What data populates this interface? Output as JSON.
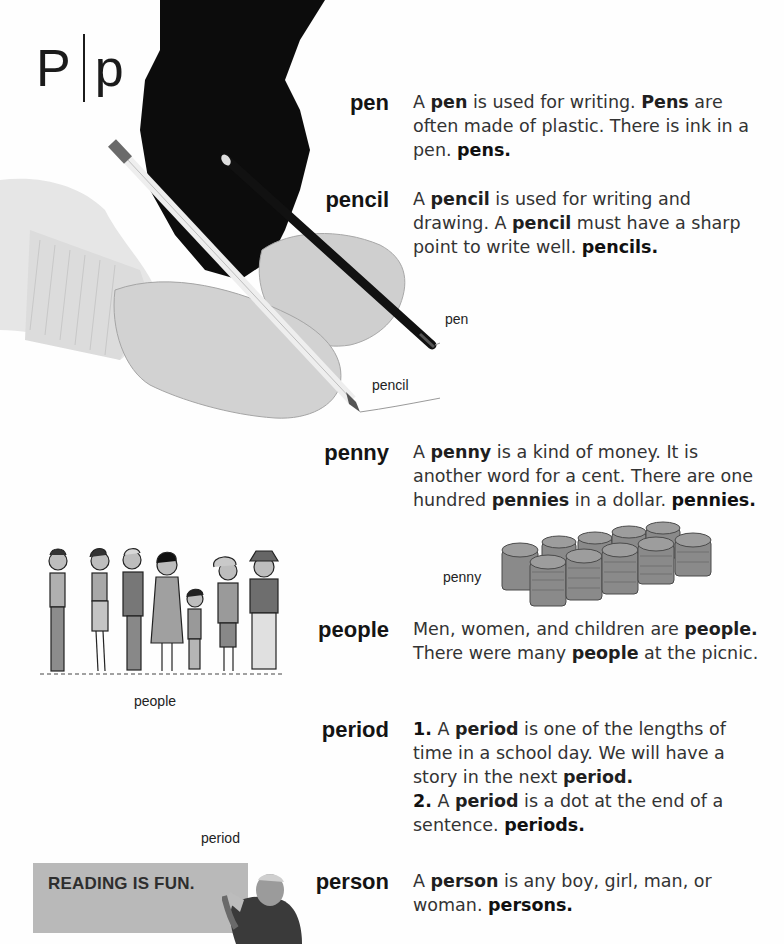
{
  "header": {
    "uppercase": "P",
    "lowercase": "p"
  },
  "entries": [
    {
      "word": "pen",
      "definition": [
        {
          "t": "A "
        },
        {
          "t": "pen",
          "k": "kw"
        },
        {
          "t": " is used for writing. "
        },
        {
          "t": "Pens",
          "k": "kw"
        },
        {
          "t": " are often made of plastic. There is ink in a pen. "
        },
        {
          "t": "pens.",
          "k": "plural"
        }
      ]
    },
    {
      "word": "pencil",
      "definition": [
        {
          "t": "A "
        },
        {
          "t": "pencil",
          "k": "kw"
        },
        {
          "t": " is used for writing and drawing. A "
        },
        {
          "t": "pencil",
          "k": "kw"
        },
        {
          "t": " must have a sharp point to write well. "
        },
        {
          "t": "pencils.",
          "k": "plural"
        }
      ]
    },
    {
      "word": "penny",
      "definition": [
        {
          "t": "A "
        },
        {
          "t": "penny",
          "k": "kw"
        },
        {
          "t": " is a kind of money. It is another word for a cent. There are one hundred "
        },
        {
          "t": "pennies",
          "k": "kw"
        },
        {
          "t": " in a dollar. "
        },
        {
          "t": "pennies.",
          "k": "plural"
        }
      ]
    },
    {
      "word": "people",
      "definition": [
        {
          "t": "Men, women, and children are "
        },
        {
          "t": "people.",
          "k": "kw"
        },
        {
          "t": " There were many "
        },
        {
          "t": "people",
          "k": "kw"
        },
        {
          "t": " at the picnic."
        }
      ]
    },
    {
      "word": "period",
      "definition": [
        {
          "t": "1.",
          "k": "num"
        },
        {
          "t": " A "
        },
        {
          "t": "period",
          "k": "kw"
        },
        {
          "t": " is one of the lengths of time in a school day. We will have a story in the next "
        },
        {
          "t": "period.",
          "k": "kw"
        },
        {
          "t": "\n"
        },
        {
          "t": "2.",
          "k": "num"
        },
        {
          "t": " A "
        },
        {
          "t": "period",
          "k": "kw"
        },
        {
          "t": " is a dot at the end of a sentence. "
        },
        {
          "t": "periods.",
          "k": "plural"
        }
      ]
    },
    {
      "word": "person",
      "definition": [
        {
          "t": "A "
        },
        {
          "t": "person",
          "k": "kw"
        },
        {
          "t": " is any boy, girl, man, or woman. "
        },
        {
          "t": "persons.",
          "k": "plural"
        }
      ]
    }
  ],
  "captions": {
    "pen": "pen",
    "pencil": "pencil",
    "penny": "penny",
    "people": "people",
    "period": "period"
  },
  "sign": {
    "text": "READING IS FUN."
  },
  "colors": {
    "headword": "#141414",
    "body_text": "#333333",
    "sleeve": "#0c0c0c",
    "sign_bg": "#b9b9b9"
  }
}
